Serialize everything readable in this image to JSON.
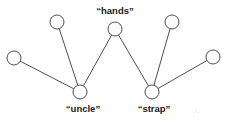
{
  "figure": {
    "kind": "graph-diagram",
    "width": 230,
    "height": 124,
    "background_color": "#ffffff",
    "stroke_color": "#3a3a3a",
    "node_fill_color": "#ffffff",
    "label_color": "#1a1a1a"
  },
  "chart_data": {
    "type": "graph",
    "title": "",
    "xlabel": "",
    "ylabel": "",
    "grid": false,
    "legend": "none",
    "node_radius": 7,
    "nodes": [
      {
        "id": "n1",
        "label": "",
        "x": 14,
        "y": 58,
        "labeled": false,
        "label_position": "none"
      },
      {
        "id": "n2",
        "label": "",
        "x": 57,
        "y": 22,
        "labeled": false,
        "label_position": "none"
      },
      {
        "id": "n3",
        "label": "“hands”",
        "x": 115,
        "y": 29,
        "labeled": true,
        "label_position": "above"
      },
      {
        "id": "n4",
        "label": "",
        "x": 172,
        "y": 22,
        "labeled": false,
        "label_position": "none"
      },
      {
        "id": "n5",
        "label": "",
        "x": 213,
        "y": 57,
        "labeled": false,
        "label_position": "none"
      },
      {
        "id": "n6",
        "label": "“uncle”",
        "x": 80,
        "y": 92,
        "labeled": true,
        "label_position": "below"
      },
      {
        "id": "n7",
        "label": "“strap”",
        "x": 152,
        "y": 92,
        "labeled": true,
        "label_position": "below"
      }
    ],
    "edges": [
      {
        "from": "n1",
        "to": "n6"
      },
      {
        "from": "n2",
        "to": "n6"
      },
      {
        "from": "n3",
        "to": "n6"
      },
      {
        "from": "n3",
        "to": "n7"
      },
      {
        "from": "n4",
        "to": "n7"
      },
      {
        "from": "n5",
        "to": "n7"
      }
    ],
    "labels": [
      {
        "text": "“hands”",
        "x": 115,
        "y": 5
      },
      {
        "text": "“uncle”",
        "x": 83,
        "y": 103
      },
      {
        "text": "“strap”",
        "x": 154,
        "y": 103
      }
    ]
  }
}
